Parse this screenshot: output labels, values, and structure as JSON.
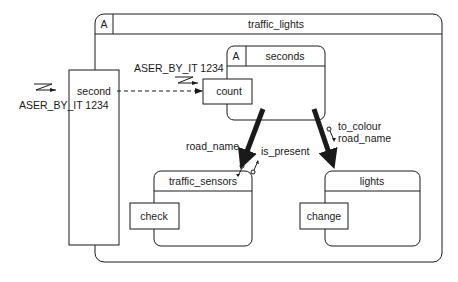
{
  "diagram": {
    "outer": {
      "label_a": "A",
      "title": "traffic_lights"
    },
    "second_block": {
      "label": "second"
    },
    "seconds_block": {
      "label_a": "A",
      "title": "seconds",
      "port": "count"
    },
    "traffic_sensors_block": {
      "title": "traffic_sensors",
      "port": "check"
    },
    "lights_block": {
      "title": "lights",
      "port": "change"
    },
    "labels": {
      "external_signal": "ASER_BY_IT 1234",
      "internal_signal": "ASER_BY_IT 1234",
      "road_name_left": "road_name",
      "is_present": "is_present",
      "to_colour": "to_colour",
      "road_name_right": "road_name"
    },
    "colors": {
      "line": "#1a1a1a",
      "background": "#ffffff"
    }
  }
}
